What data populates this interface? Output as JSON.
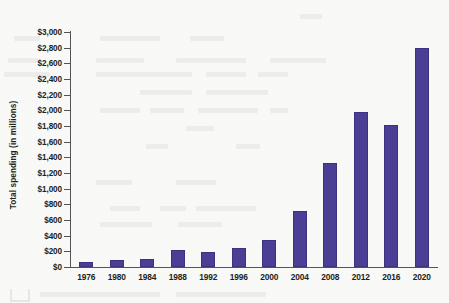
{
  "chart_data": {
    "type": "bar",
    "title": "",
    "xlabel": "",
    "ylabel": "Total spending (in millions)",
    "categories": [
      "1976",
      "1980",
      "1984",
      "1988",
      "1992",
      "1996",
      "2000",
      "2004",
      "2008",
      "2012",
      "2016",
      "2020"
    ],
    "values": [
      70,
      90,
      105,
      215,
      195,
      245,
      350,
      720,
      1330,
      1985,
      1810,
      2790
    ],
    "ylim": [
      0,
      3000
    ],
    "ytick_values": [
      0,
      200,
      400,
      600,
      800,
      1000,
      1200,
      1400,
      1600,
      1800,
      2000,
      2200,
      2400,
      2600,
      2800,
      3000
    ],
    "ytick_labels": [
      "$0",
      "$200",
      "$400",
      "$600",
      "$800",
      "$1,000",
      "$1,200",
      "$1,400",
      "$1,600",
      "$1,800",
      "$2,000",
      "$2,200",
      "$2,400",
      "$2,600",
      "$2,800",
      "$3,000"
    ],
    "grid": false,
    "legend": false,
    "legend_position": "none",
    "series": [
      {
        "name": "Total spending",
        "values": [
          70,
          90,
          105,
          215,
          195,
          245,
          350,
          720,
          1330,
          1985,
          1810,
          2790
        ]
      }
    ],
    "colors": {
      "bar": "#4a3f94",
      "bar_edge": "#3c3280",
      "axis": "#55525a",
      "text": "#231f20",
      "background": "#fdfdfc"
    }
  }
}
